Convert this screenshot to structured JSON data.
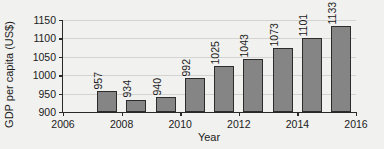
{
  "chart_data": {
    "type": "bar",
    "title": "",
    "xlabel": "Year",
    "ylabel": "GDP per capita (US$)",
    "categories": [
      2007,
      2008,
      2009,
      2010,
      2011,
      2012,
      2013,
      2014,
      2015
    ],
    "values": [
      957,
      934,
      940,
      992,
      1025,
      1043,
      1073,
      1101,
      1133
    ],
    "xlim": [
      2006,
      2016
    ],
    "ylim": [
      900,
      1150
    ],
    "xticks": [
      2006,
      2008,
      2010,
      2012,
      2014,
      2016
    ],
    "xtick_labels": [
      "2006",
      "2008",
      "2010",
      "2012",
      "2014",
      "2016"
    ],
    "yticks": [
      900,
      950,
      1000,
      1050,
      1100,
      1150
    ],
    "ytick_labels": [
      "900",
      "950",
      "1000",
      "1050",
      "1100",
      "1150"
    ],
    "grid": "horizontal",
    "legend": null,
    "bar_color": "#858585",
    "bar_edge_color": "#2c2c2c",
    "background_color": "#f1f1ef",
    "grid_color": "#d3d3d1",
    "axis_color": "#2a2a2a",
    "data_labels": [
      "957",
      "934",
      "940",
      "992",
      "1025",
      "1043",
      "1073",
      "1101",
      "1133"
    ],
    "data_label_rotation": 90
  }
}
